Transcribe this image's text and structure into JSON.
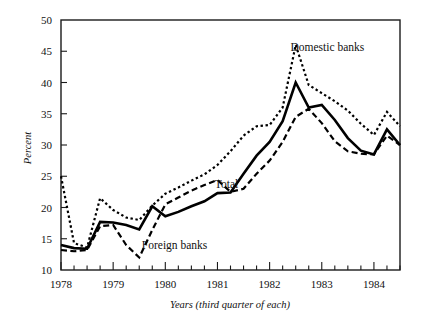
{
  "chart_data": {
    "type": "line",
    "title": "",
    "xlabel": "Years (third quarter of each)",
    "ylabel": "Percent",
    "ylim": [
      10,
      50
    ],
    "yticks": [
      10,
      15,
      20,
      25,
      30,
      35,
      40,
      45,
      50
    ],
    "ytick_labels": [
      "10",
      "15",
      "20",
      "25",
      "30",
      "35",
      "40",
      "45",
      "50"
    ],
    "xlim": [
      1978.0,
      1984.5
    ],
    "xticks": [
      1978,
      1979,
      1980,
      1981,
      1982,
      1983,
      1984
    ],
    "xtick_labels": [
      "1978",
      "1979",
      "1980",
      "1981",
      "1982",
      "1983",
      "1984"
    ],
    "x_minor_tick_interval": 0.25,
    "grid": false,
    "legend": "inline-annotations",
    "x": [
      1978.0,
      1978.25,
      1978.5,
      1978.75,
      1979.0,
      1979.25,
      1979.5,
      1979.75,
      1980.0,
      1980.25,
      1980.5,
      1980.75,
      1981.0,
      1981.25,
      1981.5,
      1981.75,
      1982.0,
      1982.25,
      1982.5,
      1982.75,
      1983.0,
      1983.25,
      1983.5,
      1983.75,
      1984.0,
      1984.25,
      1984.5
    ],
    "series": [
      {
        "name": "Domestic banks",
        "style": "dotted",
        "label_x": 1982.4,
        "label_y": 45.0,
        "values": [
          25.0,
          14.3,
          13.6,
          21.5,
          19.6,
          18.4,
          18.0,
          20.3,
          22.2,
          23.2,
          24.3,
          25.3,
          26.8,
          29.0,
          31.5,
          33.0,
          33.2,
          36.0,
          46.0,
          39.6,
          38.3,
          37.0,
          35.5,
          33.4,
          31.6,
          35.3,
          33.0
        ]
      },
      {
        "name": "Total",
        "style": "solid",
        "label_x": 1980.95,
        "label_y": 23.2,
        "values": [
          14.0,
          13.5,
          13.4,
          17.7,
          17.6,
          17.2,
          16.5,
          20.2,
          18.6,
          19.3,
          20.2,
          21.0,
          22.3,
          22.4,
          25.4,
          28.3,
          30.5,
          33.8,
          40.0,
          36.0,
          36.4,
          34.0,
          31.1,
          29.1,
          28.5,
          32.5,
          30.0
        ]
      },
      {
        "name": "Foreign banks",
        "style": "dashed",
        "label_x": 1979.55,
        "label_y": 13.4,
        "values": [
          13.2,
          13.0,
          13.2,
          17.0,
          17.2,
          14.0,
          12.0,
          16.4,
          20.5,
          21.6,
          22.7,
          23.6,
          24.4,
          22.5,
          23.0,
          25.4,
          27.5,
          30.5,
          34.5,
          35.8,
          33.5,
          30.6,
          29.0,
          28.6,
          28.5,
          31.5,
          30.0
        ]
      }
    ]
  },
  "annotations": {
    "domestic_label": "Domestic banks",
    "total_label": "Total",
    "foreign_label": "Foreign banks"
  },
  "axis": {
    "y_title": "Percent",
    "x_title": "Years (third quarter of each)"
  },
  "colors": {
    "axis": "#1a1a1a",
    "line": "#000000",
    "background": "#ffffff"
  }
}
